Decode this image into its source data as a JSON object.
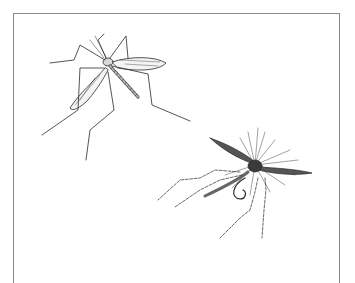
{
  "illustration": {
    "subject": "Pencil sketch of a crane fly and an artificial crane-fly fishing fly",
    "frame_color": "#8a8a8a",
    "ink_color": "#2a2a2a",
    "background_color": "#ffffff",
    "figures": [
      {
        "name": "crane-fly",
        "position": "upper-left"
      },
      {
        "name": "fishing-fly",
        "position": "lower-right"
      }
    ]
  }
}
